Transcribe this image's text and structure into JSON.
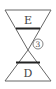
{
  "diagram": {
    "top_label": "E",
    "bottom_label": "D",
    "marker": "3",
    "stroke_color": "#555555",
    "bar_color": "#222222"
  }
}
